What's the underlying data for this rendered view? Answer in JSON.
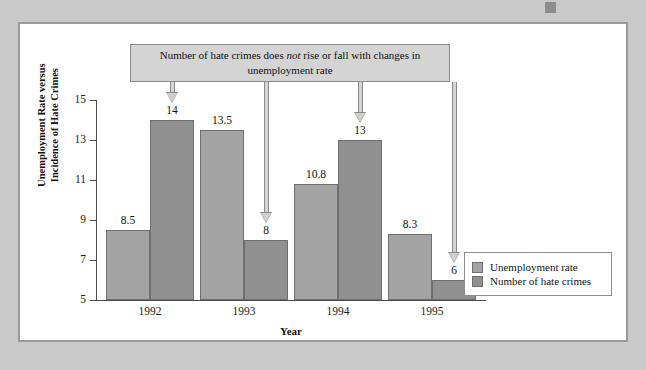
{
  "figure": {
    "callout_prefix": "Number of hate crimes does ",
    "callout_emphasis": "not",
    "callout_suffix": " rise or fall with changes in unemployment rate",
    "callout_full": "Number of hate crimes does not rise or fall with changes in unemployment rate"
  },
  "chart_data": {
    "type": "bar",
    "title": "",
    "categories": [
      "1992",
      "1993",
      "1994",
      "1995"
    ],
    "series": [
      {
        "name": "Unemployment rate",
        "color": "#a3a3a3",
        "values": [
          8.5,
          13.5,
          10.8,
          8.3
        ],
        "labels": [
          "8.5",
          "13.5",
          "10.8",
          "8.3"
        ]
      },
      {
        "name": "Number of hate crimes",
        "color": "#909090",
        "values": [
          14,
          8,
          13,
          6
        ],
        "labels": [
          "14",
          "8",
          "13",
          "6"
        ]
      }
    ],
    "xlabel": "Year",
    "ylabel": "Unemployment Rate versus Incidence of Hate Crimes",
    "ylabel_line1": "Unemployment Rate versus",
    "ylabel_line2": "Incidence of Hate Crimes",
    "ylim": [
      5,
      15
    ],
    "yticks": [
      5,
      7,
      9,
      11,
      13,
      15
    ],
    "ytick_labels": [
      "5",
      "7",
      "9",
      "11",
      "13",
      "15"
    ],
    "grid": false,
    "legend_position": "bottom-right",
    "annotations": [
      {
        "text": "Number of hate crimes does not rise or fall with changes in unemployment rate",
        "points_to": [
          "1992 hate crimes",
          "1993 hate crimes",
          "1994 hate crimes",
          "1995 hate crimes"
        ]
      }
    ]
  }
}
